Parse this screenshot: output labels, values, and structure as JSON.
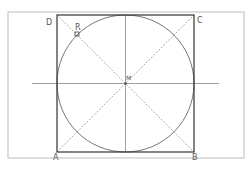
{
  "figure": {
    "labels": {
      "A": "A",
      "B": "B",
      "C": "C",
      "D": "D",
      "M": "M",
      "R": "R"
    }
  },
  "colors": {
    "frame": "#bdbdbd",
    "square": "#333333",
    "circle": "#666666",
    "diagonal": "#999999",
    "axis": "#888888",
    "label": "#555555"
  }
}
